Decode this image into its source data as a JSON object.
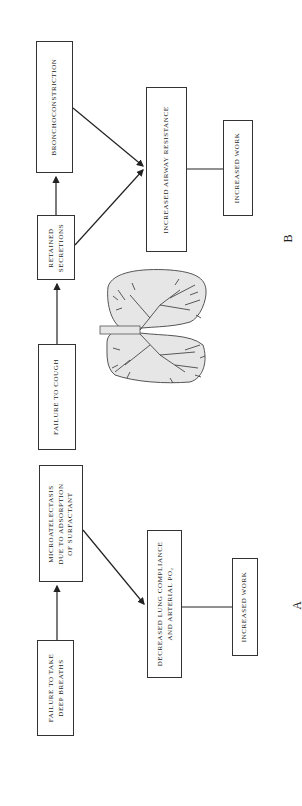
{
  "diagram": {
    "panel_a": {
      "label": "A",
      "nodes": {
        "failure_deep_breaths": {
          "line1": "FAILURE TO TAKE",
          "line2": "DEEP BREATHS"
        },
        "microatelectasis": {
          "line1": "MICROATELECTASIS",
          "line2": "DUE TO ADSORPTION",
          "line3": "OF SURFACTANT"
        },
        "decreased_compliance": {
          "line1": "DECREASED LUNG COMPLIANCE",
          "line2": "AND ARTERIAL pO₂"
        },
        "increased_work": {
          "line1": "INCREASED WORK"
        }
      },
      "edges": [
        {
          "from": "failure_deep_breaths",
          "to": "microatelectasis",
          "type": "arrow"
        },
        {
          "from": "microatelectasis",
          "to": "decreased_compliance",
          "type": "arrow"
        },
        {
          "from": "decreased_compliance",
          "to": "increased_work",
          "type": "line"
        }
      ]
    },
    "panel_b": {
      "label": "B",
      "nodes": {
        "failure_cough": {
          "line1": "FAILURE TO COUGH"
        },
        "retained_secretions": {
          "line1": "RETAINED",
          "line2": "SECRETIONS"
        },
        "bronchoconstriction": {
          "line1": "BRONCHOCONSTRICTION"
        },
        "airway_resistance": {
          "line1": "INCREASED AIRWAY RESISTANCE"
        },
        "increased_work": {
          "line1": "INCREASED WORK"
        }
      },
      "edges": [
        {
          "from": "failure_cough",
          "to": "retained_secretions",
          "type": "arrow"
        },
        {
          "from": "retained_secretions",
          "to": "bronchoconstriction",
          "type": "arrow"
        },
        {
          "from": "retained_secretions",
          "to": "airway_resistance",
          "type": "arrow"
        },
        {
          "from": "bronchoconstriction",
          "to": "airway_resistance",
          "type": "arrow"
        },
        {
          "from": "airway_resistance",
          "to": "increased_work",
          "type": "line"
        }
      ]
    },
    "illustration": "lungs-illustration"
  }
}
